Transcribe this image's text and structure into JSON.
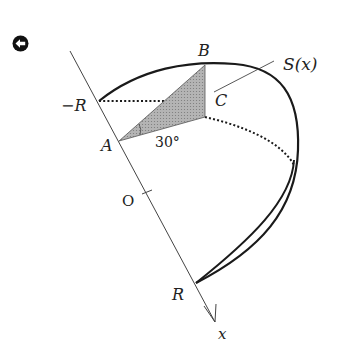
{
  "navigation": {
    "back_icon": "circle-arrow-left-icon"
  },
  "figure": {
    "labels": {
      "neg_r": "−R",
      "r": "R",
      "origin": "O",
      "a": "A",
      "b": "B",
      "c": "C",
      "angle": "30°",
      "area": "S(x)",
      "axis": "x"
    },
    "angle_deg": 30,
    "colors": {
      "stroke": "#1a1a1a",
      "shade": "#a8a8a8",
      "axis": "#444444"
    }
  }
}
